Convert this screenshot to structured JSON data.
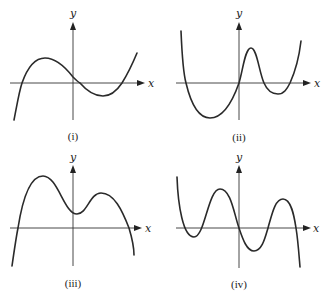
{
  "figure": {
    "panels": [
      {
        "id": "i",
        "caption": "(i)",
        "x_label": "x",
        "y_label": "y",
        "curve_description": "cubic, rises from bottom-left, local max left of y-axis, local min right of y-axis, rises to top-right; 3 x-intercepts"
      },
      {
        "id": "ii",
        "caption": "(ii)",
        "x_label": "x",
        "y_label": "y",
        "curve_description": "quartic, both ends up, deep min left, passes through origin, local max right of y-axis, shallow min, 4 x-intercepts"
      },
      {
        "id": "iii",
        "caption": "(iii)",
        "x_label": "x",
        "y_label": "y",
        "curve_description": "quartic, both ends down, two local maxima with a local min above x-axis near y-axis, 2 x-intercepts"
      },
      {
        "id": "iv",
        "caption": "(iv)",
        "x_label": "x",
        "y_label": "y",
        "curve_description": "quintic, starts top-left, ends bottom-right, passes through origin, 5 x-intercepts"
      }
    ]
  },
  "colors": {
    "curve": "#2a2a2a",
    "axis": "#333333",
    "background": "#ffffff"
  }
}
